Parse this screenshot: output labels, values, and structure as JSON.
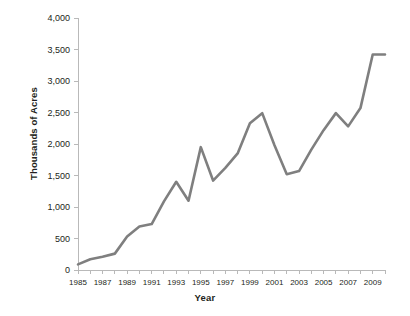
{
  "chart_data": {
    "type": "line",
    "title": "",
    "xlabel": "Year",
    "ylabel": "Thousands of Acres",
    "xlim": [
      1985,
      2010
    ],
    "ylim": [
      0,
      4000
    ],
    "grid": false,
    "legend": "none",
    "line_color": "#7f7f7f",
    "x_tick_labels": [
      "1985",
      "1987",
      "1989",
      "1991",
      "1993",
      "1995",
      "1997",
      "1999",
      "2001",
      "2003",
      "2005",
      "2007",
      "2009"
    ],
    "x_tick_values": [
      1985,
      1987,
      1989,
      1991,
      1993,
      1995,
      1997,
      1999,
      2001,
      2003,
      2005,
      2007,
      2009
    ],
    "x_minor_ticks": [
      1985,
      1986,
      1987,
      1988,
      1989,
      1990,
      1991,
      1992,
      1993,
      1994,
      1995,
      1996,
      1997,
      1998,
      1999,
      2000,
      2001,
      2002,
      2003,
      2004,
      2005,
      2006,
      2007,
      2008,
      2009,
      2010
    ],
    "y_tick_labels": [
      "0",
      "500",
      "1,000",
      "1,500",
      "2,000",
      "2,500",
      "3,000",
      "3,500",
      "4,000"
    ],
    "y_tick_values": [
      0,
      500,
      1000,
      1500,
      2000,
      2500,
      3000,
      3500,
      4000
    ],
    "x": [
      1985,
      1986,
      1987,
      1988,
      1989,
      1990,
      1991,
      1992,
      1993,
      1994,
      1995,
      1996,
      1997,
      1998,
      1999,
      2000,
      2001,
      2002,
      2003,
      2004,
      2005,
      2006,
      2007,
      2008,
      2009,
      2010
    ],
    "values": [
      90,
      170,
      210,
      260,
      530,
      690,
      730,
      1090,
      1400,
      1100,
      1950,
      1420,
      1620,
      1850,
      2330,
      2490,
      1980,
      1520,
      1570,
      1910,
      2220,
      2490,
      2280,
      2570,
      3420,
      3420
    ],
    "series": [
      {
        "name": "Acres",
        "values": [
          90,
          170,
          210,
          260,
          530,
          690,
          730,
          1090,
          1400,
          1100,
          1950,
          1420,
          1620,
          1850,
          2330,
          2490,
          1980,
          1520,
          1570,
          1910,
          2220,
          2490,
          2280,
          2570,
          3420,
          3420
        ]
      }
    ]
  }
}
